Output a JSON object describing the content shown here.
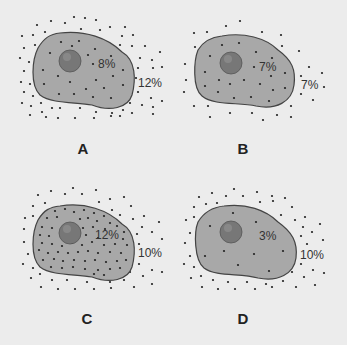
{
  "diagram": {
    "type": "cell osmosis comparison",
    "colors": {
      "background": "#ececec",
      "cytoplasm": "#a8a8a8",
      "outline": "#444444",
      "nucleus": "#777777",
      "dots": "#222222"
    },
    "panels": [
      {
        "id": "A",
        "label": "A",
        "inside": "8%",
        "outside": "12%",
        "inside_density": "medium",
        "outside_density": "high"
      },
      {
        "id": "B",
        "label": "B",
        "inside": "7%",
        "outside": "7%",
        "inside_density": "low",
        "outside_density": "low"
      },
      {
        "id": "C",
        "label": "C",
        "inside": "12%",
        "outside": "10%",
        "inside_density": "high",
        "outside_density": "medium"
      },
      {
        "id": "D",
        "label": "D",
        "inside": "3%",
        "outside": "10%",
        "inside_density": "very-low",
        "outside_density": "medium"
      }
    ]
  }
}
